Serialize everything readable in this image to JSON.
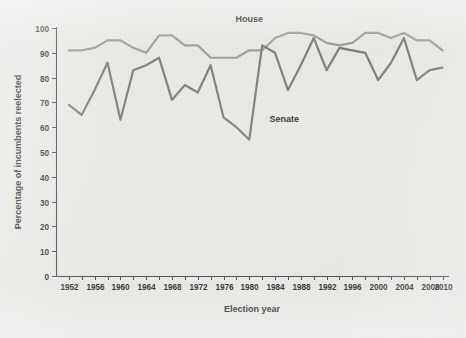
{
  "figure": {
    "background_color": "#e9e9e6",
    "plot_area": {
      "left": 56,
      "right": 449,
      "top": 28,
      "bottom": 276
    }
  },
  "chart_data": {
    "type": "line",
    "title": "",
    "xlabel": "Election year",
    "ylabel": "Percentage of incumbents reelected",
    "xlim": [
      1950,
      2011
    ],
    "ylim": [
      0,
      100
    ],
    "grid": false,
    "legend": "inline-labels",
    "x": [
      1952,
      1954,
      1956,
      1958,
      1960,
      1962,
      1964,
      1966,
      1968,
      1970,
      1972,
      1974,
      1976,
      1978,
      1980,
      1982,
      1984,
      1986,
      1988,
      1990,
      1992,
      1994,
      1996,
      1998,
      2000,
      2002,
      2004,
      2006,
      2008,
      2010
    ],
    "xticks": [
      1952,
      1954,
      1956,
      1958,
      1960,
      1962,
      1964,
      1966,
      1968,
      1970,
      1972,
      1974,
      1976,
      1978,
      1980,
      1982,
      1984,
      1986,
      1988,
      1990,
      1992,
      1994,
      1996,
      1998,
      2000,
      2002,
      2004,
      2006,
      2008,
      2010
    ],
    "xtick_labels": [
      "1952",
      "",
      "1956",
      "",
      "1960",
      "",
      "1964",
      "",
      "1968",
      "",
      "1972",
      "",
      "1976",
      "",
      "1980",
      "",
      "1984",
      "",
      "1988",
      "",
      "1992",
      "",
      "1996",
      "",
      "2000",
      "",
      "2004",
      "",
      "2008",
      "2010"
    ],
    "xtick_labels_shown": [
      "1952",
      "1956",
      "1960",
      "1964",
      "1968",
      "1972",
      "1976",
      "1980",
      "1984",
      "1988",
      "1992",
      "1996",
      "2000",
      "2004",
      "2008",
      "2010"
    ],
    "yticks": [
      0,
      10,
      20,
      30,
      40,
      50,
      60,
      70,
      80,
      90,
      100
    ],
    "ytick_labels": [
      "0",
      "10",
      "20",
      "30",
      "40",
      "50",
      "60",
      "70",
      "80",
      "90",
      "100"
    ],
    "series": [
      {
        "name": "House",
        "color": "#9a9a96",
        "label_x": 1980,
        "label_y": 100,
        "values": [
          91,
          91,
          92,
          95,
          95,
          92,
          90,
          97,
          97,
          93,
          93,
          88,
          88,
          88,
          91,
          91,
          96,
          98,
          98,
          97,
          94,
          93,
          94,
          98,
          98,
          96,
          98,
          95,
          95,
          91
        ]
      },
      {
        "name": "Senate",
        "color": "#787874",
        "label_x": 1982,
        "label_y": 62,
        "values": [
          69,
          65,
          75,
          86,
          63,
          83,
          85,
          88,
          71,
          77,
          74,
          85,
          64,
          60,
          55,
          93,
          90,
          75,
          85,
          96,
          83,
          92,
          91,
          90,
          79,
          86,
          96,
          79,
          83,
          84
        ]
      }
    ]
  },
  "labels": {
    "house": "House",
    "senate": "Senate",
    "x_axis_title": "Election year",
    "y_axis_title": "Percentage of incumbents reelected"
  }
}
